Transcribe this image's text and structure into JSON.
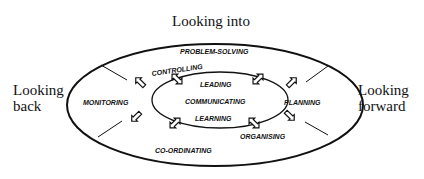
{
  "diagram": {
    "outer_labels": {
      "top": "Looking into",
      "left_line1": "Looking",
      "left_line2": "back",
      "right_line1": "Looking",
      "right_line2": "forward"
    },
    "outer_ring": {
      "top": "PROBLEM-SOLVING",
      "left": "MONITORING",
      "right": "PLANNING",
      "bottom": "CO-ORDINATING",
      "upper_left": "CONTROLLING",
      "lower_right": "ORGANISING"
    },
    "inner_core": [
      "LEADING",
      "COMMUNICATING",
      "LEARNING"
    ],
    "arrows": [
      "double-arrow-upper-left",
      "double-arrow-upper-right",
      "double-arrow-lower-left",
      "double-arrow-lower-right",
      "arrow-outer-upper-left",
      "arrow-outer-upper-right",
      "arrow-outer-lower-left",
      "arrow-outer-lower-right"
    ]
  }
}
